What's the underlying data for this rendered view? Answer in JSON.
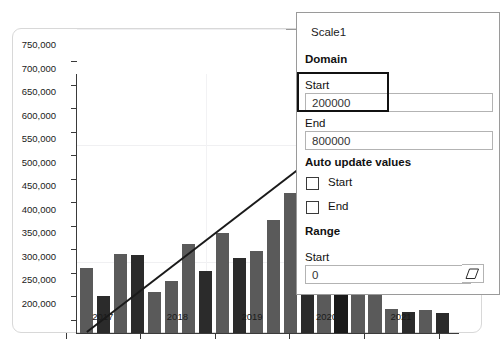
{
  "chart_data": {
    "type": "bar",
    "title": "",
    "xlabel": "",
    "ylabel": "",
    "ylim": [
      200000,
      750000
    ],
    "ytick_step": 50000,
    "ytick_labels": [
      "750,000",
      "700,000",
      "650,000",
      "600,000",
      "550,000",
      "500,000",
      "450,000",
      "400,000",
      "350,000",
      "300,000",
      "250,000",
      "200,000"
    ],
    "ytick_values": [
      750000,
      700000,
      650000,
      600000,
      550000,
      500000,
      450000,
      400000,
      350000,
      300000,
      250000,
      200000
    ],
    "categories": [
      "2017",
      "2018",
      "2019",
      "2020",
      "2021"
    ],
    "grid": "faint-horizontal-and-vertical",
    "legend": "none",
    "series": [
      {
        "name": "Value",
        "note": "quarterly bars, alternating dark-grey / near-black fills; bars after 2019Q4 are occluded by the properties panel",
        "points": [
          {
            "period": "2017Q1",
            "value": 338000,
            "shade": "#5a5a5a"
          },
          {
            "period": "2017Q2",
            "value": 278000,
            "shade": "#2b2b2b"
          },
          {
            "period": "2017Q3",
            "value": 368000,
            "shade": "#5a5a5a"
          },
          {
            "period": "2017Q4",
            "value": 366000,
            "shade": "#2b2b2b"
          },
          {
            "period": "2018Q1",
            "value": 287000,
            "shade": "#5a5a5a"
          },
          {
            "period": "2018Q2",
            "value": 310000,
            "shade": "#5a5a5a"
          },
          {
            "period": "2018Q3",
            "value": 389000,
            "shade": "#5a5a5a"
          },
          {
            "period": "2018Q4",
            "value": 332000,
            "shade": "#2b2b2b"
          },
          {
            "period": "2019Q1",
            "value": 413000,
            "shade": "#5a5a5a"
          },
          {
            "period": "2019Q2",
            "value": 360000,
            "shade": "#2b2b2b"
          },
          {
            "period": "2019Q3",
            "value": 375000,
            "shade": "#5a5a5a"
          },
          {
            "period": "2019Q4",
            "value": 441000,
            "shade": "#5a5a5a"
          },
          {
            "period": "2020Q1",
            "value": 497000,
            "shade": "#5a5a5a"
          },
          {
            "period": "2020Q2",
            "value": 440000,
            "shade": "#2b2b2b"
          },
          {
            "period": "2020Q3",
            "value": 393000,
            "shade": "#5a5a5a"
          },
          {
            "period": "2020Q4",
            "value": 553000,
            "shade": "#1a1a1a"
          },
          {
            "period": "2021Q1",
            "value": 416000,
            "shade": "#5a5a5a"
          },
          {
            "period": "2021Q2",
            "value": 366000,
            "shade": "#5a5a5a"
          },
          {
            "period": "2021Q3",
            "value": 250000,
            "shade": "#5a5a5a"
          },
          {
            "period": "2021Q4",
            "value": 245000,
            "shade": "#2b2b2b"
          },
          {
            "period": "2021Q5",
            "value": 248000,
            "shade": "#5a5a5a"
          },
          {
            "period": "2021Q6",
            "value": 243000,
            "shade": "#2b2b2b"
          }
        ]
      }
    ],
    "trendline": {
      "name": "Linear trend",
      "color": "#1a1a1a",
      "start": {
        "x_category": "2017Q1",
        "y": 202000
      },
      "end": {
        "x_category": "2021Q1",
        "y": 645000
      }
    }
  },
  "panel": {
    "title": "Scale1",
    "domain": {
      "heading": "Domain",
      "start_label": "Start",
      "start_value": "200000",
      "end_label": "End",
      "end_value": "800000"
    },
    "auto_update": {
      "heading": "Auto update values",
      "start_label": "Start",
      "start_checked": false,
      "end_label": "End",
      "end_checked": false
    },
    "range": {
      "heading": "Range",
      "start_label": "Start",
      "start_value": "0",
      "clear_icon": "eraser-icon"
    }
  },
  "colors": {
    "bar_grey": "#5a5a5a",
    "bar_dark": "#2b2b2b",
    "bar_black": "#1a1a1a",
    "axis": "#3a3a3a",
    "panel_border": "#9a9a9a",
    "focus_ring": "#111111",
    "card_border": "#d8d8d8"
  }
}
